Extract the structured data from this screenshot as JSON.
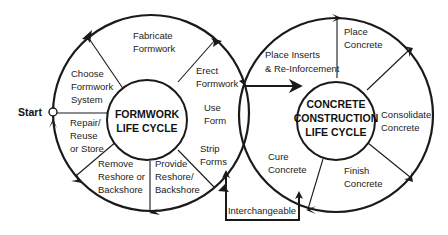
{
  "diagram": {
    "type": "process-cycle",
    "start_label": "Start",
    "formwork": {
      "center_title_line1": "FORMWORK",
      "center_title_line2": "LIFE CYCLE",
      "steps": [
        {
          "line1": "Choose",
          "line2": "Formwork",
          "line3": "System"
        },
        {
          "line1": "Fabricate",
          "line2": "Formwork"
        },
        {
          "line1": "Erect",
          "line2": "Formwork"
        },
        {
          "line1": "Use",
          "line2": "Form"
        },
        {
          "line1": "Strip",
          "line2": "Forms"
        },
        {
          "line1": "Provide",
          "line2": "Reshore/",
          "line3": "Backshore"
        },
        {
          "line1": "Remove",
          "line2": "Reshore or",
          "line3": "Backshore"
        },
        {
          "line1": "Repair/",
          "line2": "Reuse",
          "line3": "or Store"
        }
      ]
    },
    "concrete": {
      "center_title_line1": "CONCRETE",
      "center_title_line2": "CONSTRUCTION",
      "center_title_line3": "LIFE CYCLE",
      "steps": [
        {
          "line1": "Place Inserts",
          "line2": "& Re-Inforcement"
        },
        {
          "line1": "Place",
          "line2": "Concrete"
        },
        {
          "line1": "Consolidate",
          "line2": "Concrete"
        },
        {
          "line1": "Finish",
          "line2": "Concrete"
        },
        {
          "line1": "Cure",
          "line2": "Concrete"
        }
      ]
    },
    "link_label": "Interchangeable",
    "colors": {
      "stroke": "#1a1a1a",
      "background": "#ffffff"
    }
  }
}
